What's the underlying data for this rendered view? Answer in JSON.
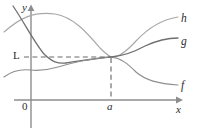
{
  "figure": {
    "axes": {
      "x_label": "x",
      "y_label": "y",
      "origin_label": "0"
    },
    "markers": {
      "limit_label": "L",
      "point_label": "a"
    },
    "curve_labels": {
      "f": "f",
      "g": "g",
      "h": "h"
    },
    "colors": {
      "axis": "#8d8d8d",
      "curve_f": "#8f8f8f",
      "curve_g": "#6f6f6f",
      "curve_h": "#a8a8a8",
      "dashed": "#6a6a6a",
      "text": "#2b2b2b",
      "background": "#ffffff"
    }
  },
  "chart_data": {
    "type": "line",
    "title": "",
    "xlabel": "x",
    "ylabel": "y",
    "grid": false,
    "legend": "right-inline",
    "annotations": [
      {
        "name": "limit-level",
        "label": "L",
        "type": "horizontal-dashed",
        "y": 57
      },
      {
        "name": "point-a",
        "label": "a",
        "type": "vertical-dashed",
        "x": 111
      },
      {
        "name": "origin",
        "label": "0",
        "type": "axis-origin"
      }
    ],
    "axis_pixels": {
      "x_axis_y": 100,
      "y_axis_x": 31,
      "x_axis_end": 178,
      "y_axis_top": 7,
      "a_x": 111,
      "L_y": 57
    },
    "series": [
      {
        "name": "h",
        "label": "h",
        "role": "upper-bound",
        "path": "M 4,32 C 20,18 34,11 55,14 C 74,17 88,34 100,48 C 106,54 109,56 111,57 C 118,58 126,52 136,41 C 150,26 165,19 178,17",
        "points": [
          {
            "x": 4,
            "y": 32
          },
          {
            "x": 30,
            "y": 16
          },
          {
            "x": 55,
            "y": 14
          },
          {
            "x": 80,
            "y": 28
          },
          {
            "x": 100,
            "y": 48
          },
          {
            "x": 111,
            "y": 57
          },
          {
            "x": 130,
            "y": 47
          },
          {
            "x": 155,
            "y": 26
          },
          {
            "x": 178,
            "y": 17
          }
        ]
      },
      {
        "name": "g",
        "label": "g",
        "role": "squeezed",
        "path": "M 13,6 C 24,22 34,42 44,54 C 52,62 58,64 66,63 C 80,61 96,58 111,57 C 124,56 134,52 145,46 C 158,40 168,38 178,38",
        "points": [
          {
            "x": 13,
            "y": 6
          },
          {
            "x": 32,
            "y": 38
          },
          {
            "x": 50,
            "y": 60
          },
          {
            "x": 66,
            "y": 63
          },
          {
            "x": 90,
            "y": 59
          },
          {
            "x": 111,
            "y": 57
          },
          {
            "x": 140,
            "y": 48
          },
          {
            "x": 160,
            "y": 40
          },
          {
            "x": 178,
            "y": 38
          }
        ]
      },
      {
        "name": "f",
        "label": "f",
        "role": "lower-bound",
        "path": "M 4,77 C 12,71 20,69 30,70 C 40,71 48,70 58,67 C 75,62 94,58 111,57 C 121,58 128,64 136,72 C 145,80 158,84 178,85",
        "points": [
          {
            "x": 4,
            "y": 77
          },
          {
            "x": 22,
            "y": 69
          },
          {
            "x": 40,
            "y": 70
          },
          {
            "x": 62,
            "y": 65
          },
          {
            "x": 88,
            "y": 60
          },
          {
            "x": 111,
            "y": 57
          },
          {
            "x": 132,
            "y": 69
          },
          {
            "x": 155,
            "y": 83
          },
          {
            "x": 178,
            "y": 85
          }
        ]
      }
    ],
    "note": "f(x) <= g(x) <= h(x) near x = a; all three meet at the common value L when x = a"
  }
}
